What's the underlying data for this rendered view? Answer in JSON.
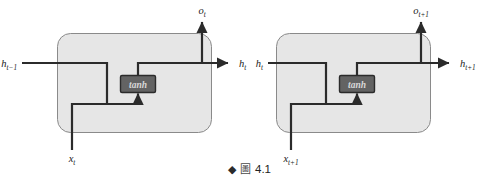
{
  "figure": {
    "domain": "diagram",
    "type": "rnn-unrolled-cell-diagram",
    "background_color": "#ffffff",
    "cell_fill_color": "#e6e6e6",
    "cell_border_color": "#8a8a8a",
    "wire_color": "#2b2b2b",
    "activation_box_fill": "#636363",
    "activation_box_text_color": "#d8d8d8"
  },
  "caption": {
    "bullet": "◆",
    "figure_word": "圖",
    "number": "4.1"
  },
  "cells": [
    {
      "id": "cell-t",
      "activation_label": "tanh",
      "input_label_base": "x",
      "input_label_sub": "t",
      "hidden_in_base": "h",
      "hidden_in_sub": "t−1",
      "hidden_out_base": "h",
      "hidden_out_sub": "t",
      "output_base": "o",
      "output_sub": "t"
    },
    {
      "id": "cell-t-plus-1",
      "activation_label": "tanh",
      "input_label_base": "x",
      "input_label_sub": "t+1",
      "hidden_in_base": "h",
      "hidden_in_sub": "t",
      "hidden_out_base": "h",
      "hidden_out_sub": "t+1",
      "output_base": "o",
      "output_sub": "t+1"
    }
  ]
}
